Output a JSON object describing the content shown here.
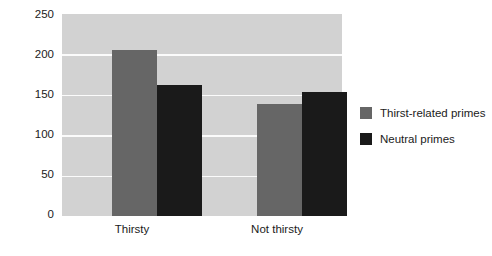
{
  "chart_data": {
    "type": "bar",
    "title": "",
    "xlabel": "",
    "ylabel": "mL Consumed",
    "categories": [
      "Thirsty",
      "Not thirsty"
    ],
    "series": [
      {
        "name": "Thirst-related primes",
        "color": "#666666",
        "values": [
          205,
          139
        ]
      },
      {
        "name": "Neutral primes",
        "color": "#1a1a1a",
        "values": [
          162,
          154
        ]
      }
    ],
    "ylim": [
      0,
      250
    ],
    "yticks": [
      0,
      50,
      100,
      150,
      200,
      250
    ],
    "ytick_labels": [
      "0",
      "50",
      "100",
      "150",
      "200",
      "250"
    ],
    "grid": "horizontal",
    "grid_color": "#fbfbfb",
    "plot_background": "#d2d2d2",
    "figure_background": "#ffffff",
    "legend_position": "right"
  },
  "legend": {
    "items": [
      {
        "label": "Thirst-related primes",
        "swatch": "legend-swatch-thirst-related"
      },
      {
        "label": "Neutral primes",
        "swatch": "legend-swatch-neutral"
      }
    ]
  },
  "axes": {
    "y_title": "mL Consumed",
    "y_tick_0": "0",
    "y_tick_1": "50",
    "y_tick_2": "100",
    "y_tick_3": "150",
    "y_tick_4": "200",
    "y_tick_5": "250",
    "x_tick_0": "Thirsty",
    "x_tick_1": "Not thirsty"
  }
}
